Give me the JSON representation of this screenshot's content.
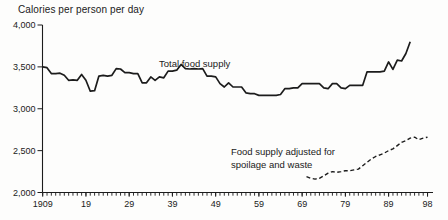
{
  "title": "Calories per person per day",
  "labels": {
    "total": "Total food supply",
    "adjusted_line1": "Food supply adjusted for",
    "adjusted_line2": "spoilage and waste"
  },
  "colors": {
    "line": "#1c1c1c",
    "axis": "#1c1c1c",
    "text": "#1a1a1a",
    "background": "#fdfdfc"
  },
  "chart_data": {
    "type": "line",
    "title": "Calories per person per day",
    "xlabel": "Year",
    "ylabel": "Calories per person per day",
    "xlim": [
      1909,
      1999
    ],
    "ylim": [
      2000,
      4000
    ],
    "grid": false,
    "legend_position": "inline-annotations",
    "y_ticks": [
      {
        "value": 4000,
        "label": "4,000"
      },
      {
        "value": 3500,
        "label": "3,500"
      },
      {
        "value": 3000,
        "label": "3,000"
      },
      {
        "value": 2500,
        "label": "2,500"
      },
      {
        "value": 2000,
        "label": "2,000"
      }
    ],
    "x_ticks": [
      {
        "year": 1909,
        "label": "1909"
      },
      {
        "year": 1919,
        "label": "19"
      },
      {
        "year": 1929,
        "label": "29"
      },
      {
        "year": 1939,
        "label": "39"
      },
      {
        "year": 1949,
        "label": "49"
      },
      {
        "year": 1959,
        "label": "59"
      },
      {
        "year": 1969,
        "label": "69"
      },
      {
        "year": 1979,
        "label": "79"
      },
      {
        "year": 1989,
        "label": "89"
      },
      {
        "year": 1998,
        "label": "98"
      }
    ],
    "minor_tick_years": {
      "start": 1909,
      "end": 1998,
      "step": 1
    },
    "series": [
      {
        "name": "Total food supply",
        "style": "solid",
        "x_start": 1909,
        "x_step": 1,
        "values": [
          3500,
          3490,
          3420,
          3420,
          3425,
          3400,
          3340,
          3345,
          3340,
          3410,
          3340,
          3210,
          3215,
          3390,
          3400,
          3390,
          3400,
          3480,
          3475,
          3430,
          3430,
          3420,
          3420,
          3310,
          3310,
          3380,
          3340,
          3380,
          3370,
          3450,
          3450,
          3460,
          3530,
          3480,
          3475,
          3480,
          3475,
          3480,
          3390,
          3390,
          3380,
          3300,
          3260,
          3310,
          3260,
          3260,
          3260,
          3190,
          3180,
          3180,
          3160,
          3160,
          3160,
          3160,
          3160,
          3170,
          3240,
          3240,
          3250,
          3250,
          3300,
          3300,
          3300,
          3300,
          3300,
          3250,
          3240,
          3300,
          3300,
          3250,
          3240,
          3280,
          3280,
          3280,
          3280,
          3440,
          3440,
          3440,
          3440,
          3450,
          3560,
          3470,
          3580,
          3570,
          3660,
          3800
        ]
      },
      {
        "name": "Food supply adjusted for spoilage and waste",
        "style": "dashed",
        "x_start": 1970,
        "x_step": 1,
        "values": [
          2190,
          2170,
          2160,
          2170,
          2200,
          2230,
          2250,
          2240,
          2250,
          2260,
          2260,
          2270,
          2280,
          2320,
          2360,
          2400,
          2430,
          2450,
          2470,
          2500,
          2520,
          2560,
          2600,
          2620,
          2650,
          2660,
          2630,
          2650,
          2660
        ]
      }
    ]
  }
}
